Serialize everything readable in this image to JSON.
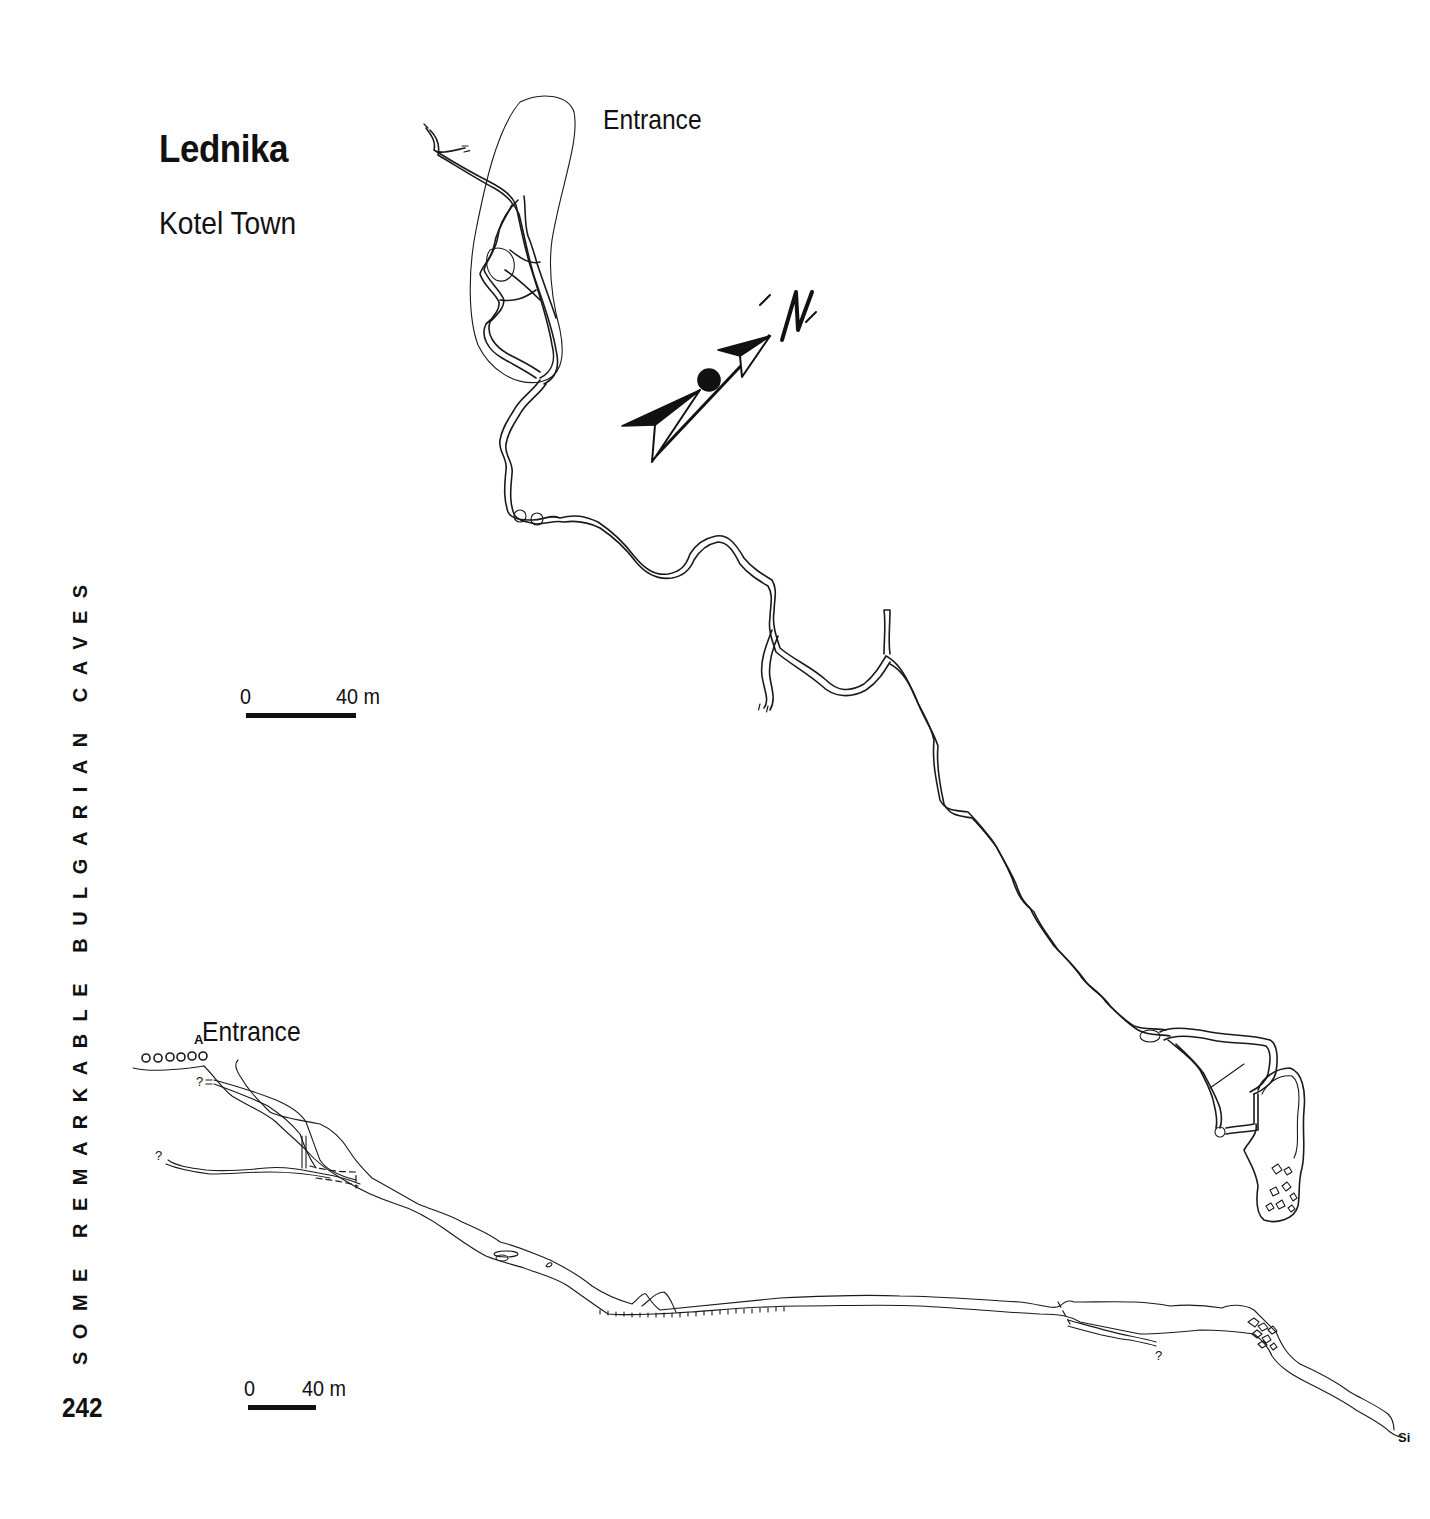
{
  "page": {
    "title": "Lednika",
    "subtitle": "Kotel Town",
    "side_heading": "SOME REMARKABLE BULGARIAN CAVES",
    "page_number": "242"
  },
  "plan_view": {
    "entrance_label": "Entrance",
    "north_arrow_label": "N",
    "scale_bar": {
      "start_label": "0",
      "end_label": "40 m"
    }
  },
  "profile_view": {
    "entrance_label": "Entrance",
    "entrance_marker": "A",
    "unknown_markers": [
      "?",
      "?",
      "?"
    ],
    "sump_label": "Si",
    "scale_bar": {
      "start_label": "0",
      "end_label": "40 m"
    }
  },
  "colors": {
    "ink": "#111111",
    "background": "#ffffff"
  }
}
